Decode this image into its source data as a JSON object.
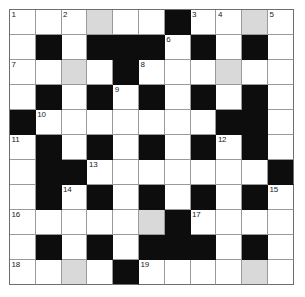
{
  "puzzle": {
    "type": "crossword-grid",
    "rows": 11,
    "cols": 11,
    "colors": {
      "white_cell": "#ffffff",
      "block_cell": "#0d0d0d",
      "shaded_cell": "#d9d9d9",
      "grid_line": "#9a9a9a",
      "grid_border": "#6e6e6e",
      "number_text": "#1a1a1a",
      "page_background": "#ffffff"
    },
    "legend": {
      "white": "open letter square",
      "block": "blocked square",
      "shaded": "highlighted letter square"
    },
    "grid": [
      [
        {
          "state": "white",
          "number": "1"
        },
        {
          "state": "white",
          "number": ""
        },
        {
          "state": "white",
          "number": "2"
        },
        {
          "state": "shaded",
          "number": ""
        },
        {
          "state": "white",
          "number": ""
        },
        {
          "state": "white",
          "number": ""
        },
        {
          "state": "block",
          "number": ""
        },
        {
          "state": "white",
          "number": "3"
        },
        {
          "state": "white",
          "number": "4"
        },
        {
          "state": "shaded",
          "number": ""
        },
        {
          "state": "white",
          "number": "5"
        }
      ],
      [
        {
          "state": "white",
          "number": ""
        },
        {
          "state": "block",
          "number": ""
        },
        {
          "state": "white",
          "number": ""
        },
        {
          "state": "block",
          "number": ""
        },
        {
          "state": "block",
          "number": ""
        },
        {
          "state": "block",
          "number": ""
        },
        {
          "state": "white",
          "number": "6"
        },
        {
          "state": "block",
          "number": ""
        },
        {
          "state": "white",
          "number": ""
        },
        {
          "state": "block",
          "number": ""
        },
        {
          "state": "white",
          "number": ""
        }
      ],
      [
        {
          "state": "white",
          "number": "7"
        },
        {
          "state": "white",
          "number": ""
        },
        {
          "state": "shaded",
          "number": ""
        },
        {
          "state": "white",
          "number": ""
        },
        {
          "state": "block",
          "number": ""
        },
        {
          "state": "white",
          "number": "8"
        },
        {
          "state": "white",
          "number": ""
        },
        {
          "state": "white",
          "number": ""
        },
        {
          "state": "shaded",
          "number": ""
        },
        {
          "state": "white",
          "number": ""
        },
        {
          "state": "white",
          "number": ""
        }
      ],
      [
        {
          "state": "white",
          "number": ""
        },
        {
          "state": "block",
          "number": ""
        },
        {
          "state": "white",
          "number": ""
        },
        {
          "state": "block",
          "number": ""
        },
        {
          "state": "white",
          "number": "9"
        },
        {
          "state": "block",
          "number": ""
        },
        {
          "state": "white",
          "number": ""
        },
        {
          "state": "block",
          "number": ""
        },
        {
          "state": "white",
          "number": ""
        },
        {
          "state": "block",
          "number": ""
        },
        {
          "state": "white",
          "number": ""
        }
      ],
      [
        {
          "state": "block",
          "number": ""
        },
        {
          "state": "white",
          "number": "10"
        },
        {
          "state": "white",
          "number": ""
        },
        {
          "state": "white",
          "number": ""
        },
        {
          "state": "white",
          "number": ""
        },
        {
          "state": "white",
          "number": ""
        },
        {
          "state": "white",
          "number": ""
        },
        {
          "state": "white",
          "number": ""
        },
        {
          "state": "block",
          "number": ""
        },
        {
          "state": "block",
          "number": ""
        },
        {
          "state": "white",
          "number": ""
        }
      ],
      [
        {
          "state": "white",
          "number": "11"
        },
        {
          "state": "block",
          "number": ""
        },
        {
          "state": "white",
          "number": ""
        },
        {
          "state": "block",
          "number": ""
        },
        {
          "state": "white",
          "number": ""
        },
        {
          "state": "block",
          "number": ""
        },
        {
          "state": "white",
          "number": ""
        },
        {
          "state": "block",
          "number": ""
        },
        {
          "state": "white",
          "number": "12"
        },
        {
          "state": "block",
          "number": ""
        },
        {
          "state": "white",
          "number": ""
        }
      ],
      [
        {
          "state": "white",
          "number": ""
        },
        {
          "state": "block",
          "number": ""
        },
        {
          "state": "block",
          "number": ""
        },
        {
          "state": "white",
          "number": "13"
        },
        {
          "state": "white",
          "number": ""
        },
        {
          "state": "white",
          "number": ""
        },
        {
          "state": "white",
          "number": ""
        },
        {
          "state": "white",
          "number": ""
        },
        {
          "state": "white",
          "number": ""
        },
        {
          "state": "white",
          "number": ""
        },
        {
          "state": "block",
          "number": ""
        }
      ],
      [
        {
          "state": "white",
          "number": ""
        },
        {
          "state": "block",
          "number": ""
        },
        {
          "state": "white",
          "number": "14"
        },
        {
          "state": "block",
          "number": ""
        },
        {
          "state": "white",
          "number": ""
        },
        {
          "state": "block",
          "number": ""
        },
        {
          "state": "white",
          "number": ""
        },
        {
          "state": "block",
          "number": ""
        },
        {
          "state": "white",
          "number": ""
        },
        {
          "state": "block",
          "number": ""
        },
        {
          "state": "white",
          "number": "15"
        }
      ],
      [
        {
          "state": "white",
          "number": "16"
        },
        {
          "state": "white",
          "number": ""
        },
        {
          "state": "white",
          "number": ""
        },
        {
          "state": "white",
          "number": ""
        },
        {
          "state": "white",
          "number": ""
        },
        {
          "state": "shaded",
          "number": ""
        },
        {
          "state": "block",
          "number": ""
        },
        {
          "state": "white",
          "number": "17"
        },
        {
          "state": "white",
          "number": ""
        },
        {
          "state": "white",
          "number": ""
        },
        {
          "state": "white",
          "number": ""
        }
      ],
      [
        {
          "state": "white",
          "number": ""
        },
        {
          "state": "block",
          "number": ""
        },
        {
          "state": "white",
          "number": ""
        },
        {
          "state": "block",
          "number": ""
        },
        {
          "state": "white",
          "number": ""
        },
        {
          "state": "block",
          "number": ""
        },
        {
          "state": "block",
          "number": ""
        },
        {
          "state": "block",
          "number": ""
        },
        {
          "state": "white",
          "number": ""
        },
        {
          "state": "block",
          "number": ""
        },
        {
          "state": "white",
          "number": ""
        }
      ],
      [
        {
          "state": "white",
          "number": "18"
        },
        {
          "state": "white",
          "number": ""
        },
        {
          "state": "shaded",
          "number": ""
        },
        {
          "state": "white",
          "number": ""
        },
        {
          "state": "block",
          "number": ""
        },
        {
          "state": "white",
          "number": "19"
        },
        {
          "state": "white",
          "number": ""
        },
        {
          "state": "white",
          "number": ""
        },
        {
          "state": "white",
          "number": ""
        },
        {
          "state": "shaded",
          "number": ""
        },
        {
          "state": "white",
          "number": ""
        }
      ]
    ]
  }
}
